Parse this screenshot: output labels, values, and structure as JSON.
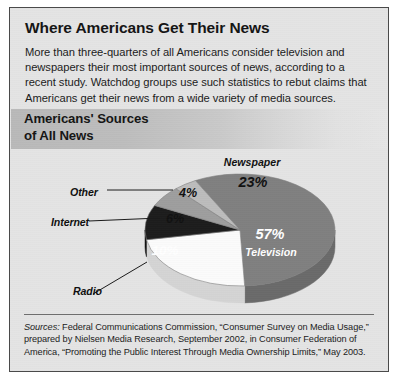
{
  "figure": {
    "title": "Where Americans Get Their News",
    "intro": "More than three-quarters of all Americans consider television and newspapers their most important sources of news, according to a recent study. Watchdog groups use such statistics to rebut claims that Americans get their news from a wide variety of media sources.",
    "chart_title_line1": "Americans' Sources",
    "chart_title_line2": "of All News",
    "source_label": "Sources:",
    "source_text": " Federal Communications Commission, “Consumer Survey on Media Usage,” prepared by Nielsen Media Research, September 2002, in Consumer Federation of America, “Promoting the Public Interest Through Media Ownership Limits,” May 2003."
  },
  "callouts": {
    "other": "Other",
    "internet": "Internet",
    "radio": "Radio"
  },
  "chart_data": {
    "type": "pie",
    "title": "Americans' Sources of All News",
    "three_d": true,
    "legend": "none",
    "categories": [
      "Television",
      "Newspaper",
      "Radio",
      "Internet",
      "Other"
    ],
    "values": [
      57,
      23,
      10,
      6,
      4
    ],
    "unit": "percent",
    "labels": [
      "57%",
      "23%",
      "10%",
      "6%",
      "4%"
    ],
    "slices": [
      {
        "name": "Television",
        "value": 57,
        "label": "57%",
        "color": "#808080",
        "side_color": "#6a6a6a",
        "text_color": "#ffffff",
        "label_placement": "inside"
      },
      {
        "name": "Newspaper",
        "value": 23,
        "label": "23%",
        "color": "#fbfbfb",
        "side_color": "#d4d4d4",
        "text_color": "#111111",
        "label_placement": "inside"
      },
      {
        "name": "Radio",
        "value": 10,
        "label": "10%",
        "color": "#1c1c1c",
        "side_color": "#131313",
        "text_color": "#ffffff",
        "label_placement": "inside-callout"
      },
      {
        "name": "Internet",
        "value": 6,
        "label": "6%",
        "color": "#9e9e9e",
        "side_color": "#868686",
        "text_color": "#111111",
        "label_placement": "inside-callout"
      },
      {
        "name": "Other",
        "value": 4,
        "label": "4%",
        "color": "#bcbcbc",
        "side_color": "#a2a2a2",
        "text_color": "#111111",
        "label_placement": "inside-callout"
      }
    ]
  }
}
